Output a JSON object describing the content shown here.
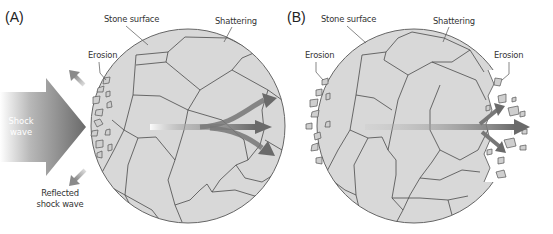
{
  "panels": [
    {
      "id": "A",
      "label": "(A)",
      "callouts": {
        "stone_surface": "Stone surface",
        "shattering": "Shattering",
        "erosion": "Erosion",
        "shock_wave_line1": "Shock",
        "shock_wave_line2": "wave",
        "reflected_line1": "Reflected",
        "reflected_line2": "shock wave"
      }
    },
    {
      "id": "B",
      "label": "(B)",
      "callouts": {
        "stone_surface": "Stone surface",
        "shattering": "Shattering",
        "erosion_left": "Erosion",
        "erosion_right": "Erosion"
      }
    }
  ],
  "colors": {
    "stone_fill": "#d8d8d8",
    "crack_line": "#4a4a4a",
    "arrow_dark": "#6e6e6e",
    "background": "#ffffff"
  }
}
